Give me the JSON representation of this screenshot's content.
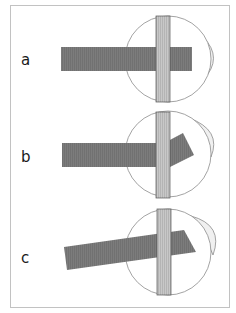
{
  "figure": {
    "colors": {
      "frame": "#bdbdbd",
      "muscle": "#7a7a7a",
      "band": "#c4c4c4",
      "band_stroke": "#555555",
      "globe_stroke": "#8c8c8c",
      "cornea_fill": "#efefef"
    },
    "panels": [
      {
        "label": "a",
        "muscle_angle_deg": 0,
        "configuration": "straight"
      },
      {
        "label": "b",
        "muscle_angle_deg": -30,
        "configuration": "bent-up-at-band"
      },
      {
        "label": "c",
        "muscle_angle_deg": -8,
        "configuration": "tilted"
      }
    ]
  }
}
